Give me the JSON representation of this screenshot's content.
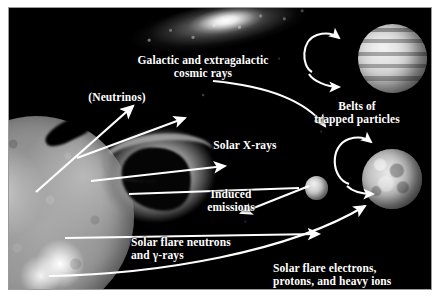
{
  "figure": {
    "background_color": "#000000",
    "label_color": "#ffffff",
    "border_color": "#9a9a9a",
    "page_color": "#ffffff"
  },
  "labels": {
    "cosmic_rays": "Galactic and extragalactic\ncosmic rays",
    "neutrinos": "(Neutrinos)",
    "belts": "Belts of\ntrapped particles",
    "solar_xrays": "Solar X-rays",
    "induced_emissions": "Induced\nemissions",
    "solar_flare_neutrons": "Solar flare neutrons\nand γ-rays",
    "solar_flare_electrons": "Solar flare electrons,\nprotons, and heavy ions"
  },
  "bodies": [
    {
      "id": "sun",
      "name": "the-sun",
      "description": "Sun",
      "position": "lower-left",
      "color": "#9a9a9a"
    },
    {
      "id": "galaxy",
      "name": "galaxy",
      "description": "Galaxy / nebula band",
      "position": "top-center",
      "color": "#e8e8e8"
    },
    {
      "id": "loop",
      "name": "coronal-loop",
      "description": "Coronal loop structure",
      "position": "center-left",
      "color": "#8f8f8f"
    },
    {
      "id": "jupiter",
      "name": "jupiter",
      "description": "Banded gas giant planet",
      "position": "upper-right",
      "color": "#d2d2d2"
    },
    {
      "id": "moon",
      "name": "cratered-moon",
      "description": "Cratered moon",
      "position": "middle-right",
      "color": "#c0c0c0"
    },
    {
      "id": "small_sphere",
      "name": "small-body",
      "description": "Small spherical body",
      "position": "center-right",
      "color": "#cfcfcf"
    }
  ],
  "arrows": [
    {
      "name": "neutrinos-arrow",
      "from": "sun",
      "to": "neutrinos-label",
      "style": "straight"
    },
    {
      "name": "cosmic-rays-arrow",
      "from": "cosmic-rays-label",
      "to": "jupiter-belts",
      "style": "curved"
    },
    {
      "name": "jupiter-belt-loop-upper",
      "from": "belt",
      "to": "jupiter",
      "style": "hook"
    },
    {
      "name": "jupiter-belt-loop-lower",
      "from": "belt",
      "to": "jupiter",
      "style": "hook"
    },
    {
      "name": "solar-xrays-arrow-upper",
      "from": "sun",
      "to": "upper-right",
      "style": "straight"
    },
    {
      "name": "solar-xrays-arrow-lower",
      "from": "sun",
      "to": "right",
      "style": "straight"
    },
    {
      "name": "induced-emissions-arrow",
      "from": "small-body",
      "to": "induced-emissions-label",
      "style": "straight"
    },
    {
      "name": "small-body-feed-arrow",
      "from": "sun",
      "to": "small-body",
      "style": "straight"
    },
    {
      "name": "moon-belt-loop-upper",
      "from": "belt",
      "to": "moon",
      "style": "hook"
    },
    {
      "name": "moon-belt-loop-lower",
      "from": "belt",
      "to": "moon",
      "style": "hook"
    },
    {
      "name": "solar-flare-neutrons-arrow",
      "from": "sun",
      "to": "right",
      "style": "straight"
    },
    {
      "name": "solar-flare-electrons-arrow",
      "from": "sun",
      "to": "moon",
      "style": "curved"
    }
  ]
}
